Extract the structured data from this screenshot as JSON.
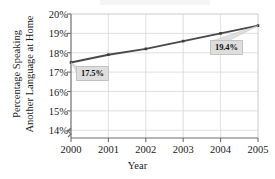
{
  "chart_data": {
    "type": "line",
    "title": "",
    "xlabel": "Year",
    "ylabel": "Percentage Speaking Another Language at Home",
    "ylabel_line1": "Percentage Speaking",
    "ylabel_line2": "Another Language at Home",
    "categories": [
      "2000",
      "2001",
      "2002",
      "2003",
      "2004",
      "2005"
    ],
    "x": [
      2000,
      2001,
      2002,
      2003,
      2004,
      2005
    ],
    "values": [
      17.5,
      17.9,
      18.2,
      18.6,
      19.0,
      19.4
    ],
    "series": [
      {
        "name": "Percentage Speaking Another Language at Home",
        "values": [
          17.5,
          17.9,
          18.2,
          18.6,
          19.0,
          19.4
        ]
      }
    ],
    "ylim": [
      13.6,
      20.0
    ],
    "xlim": [
      2000,
      2005
    ],
    "yticks": [
      14,
      15,
      16,
      17,
      18,
      19,
      20
    ],
    "ytick_labels": [
      "14%",
      "15%",
      "16%",
      "17%",
      "18%",
      "19%",
      "20%"
    ],
    "xtick_labels": [
      "2000",
      "2001",
      "2002",
      "2003",
      "2004",
      "2005"
    ],
    "grid": true,
    "grid_axis": "both",
    "legend": false,
    "legend_position": "none",
    "y_axis_break": true,
    "annotations": [
      {
        "label": "17.5%",
        "x": 2000,
        "y": 17.5
      },
      {
        "label": "19.4%",
        "x": 2005,
        "y": 19.4
      }
    ],
    "colors": {
      "line": "#4a4a4a",
      "marker": "#3d3d3d",
      "grid": "#d8d8d8",
      "axis": "#6e6e6e",
      "text": "#1b1b1b",
      "callout_fill": "#dedede",
      "callout_border": "#c3c3c3",
      "background": "#ffffff"
    }
  }
}
